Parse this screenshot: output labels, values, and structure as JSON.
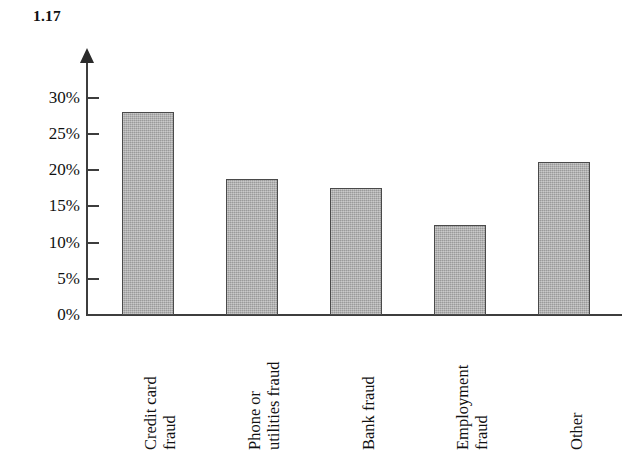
{
  "figure": {
    "number": "1.17"
  },
  "chart_data": {
    "type": "bar",
    "title": "1.17",
    "xlabel": "",
    "ylabel": "",
    "categories": [
      "Credit card fraud",
      "Phone or utilities fraud",
      "Bank fraud",
      "Employment fraud",
      "Other"
    ],
    "category_lines": [
      [
        "Credit card",
        "fraud"
      ],
      [
        "Phone or",
        "utilities fraud"
      ],
      [
        "Bank fraud"
      ],
      [
        "Employment",
        "fraud"
      ],
      [
        "Other"
      ]
    ],
    "values": [
      28.0,
      18.8,
      17.6,
      12.4,
      21.2
    ],
    "value_labels": [
      "28%",
      "18.8%",
      "17.6%",
      "12.4%",
      "21.2%"
    ],
    "ylim": [
      0,
      32.5
    ],
    "yticks": [
      0,
      5,
      10,
      15,
      20,
      25,
      30
    ],
    "ytick_labels": [
      "0%",
      "5%",
      "10%",
      "15%",
      "20%",
      "25%",
      "30%"
    ],
    "grid": false,
    "legend": null,
    "bar_fill_color": "#a9a9a9",
    "bar_edge_color": "#4a4a4a",
    "axis_color": "#3d3d3d",
    "background_color": "#ffffff"
  }
}
